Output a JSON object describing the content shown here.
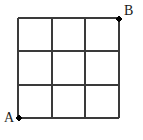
{
  "figure": {
    "kind": "lattice-grid-path-diagram",
    "width": 143,
    "height": 140,
    "background_color": "#ffffff",
    "grid": {
      "columns": 3,
      "rows": 3,
      "line_color": "#3a3a3a",
      "line_width": 1.6,
      "x_positions": [
        18,
        52,
        85,
        119
      ],
      "y_positions": [
        18,
        51,
        85,
        118
      ],
      "cell_width": 33.7,
      "cell_height": 33.3
    },
    "points": [
      {
        "id": "A",
        "label": "A",
        "x": 19,
        "y": 118,
        "radius": 2.6,
        "color": "#000000",
        "label_position": "lower-left",
        "label_x": 4,
        "label_y": 111
      },
      {
        "id": "B",
        "label": "B",
        "x": 119,
        "y": 19,
        "radius": 2.6,
        "color": "#000000",
        "label_position": "upper-right",
        "label_x": 124,
        "label_y": 4
      }
    ],
    "label_font_size": "14px",
    "label_color": "#1a1a1a"
  }
}
